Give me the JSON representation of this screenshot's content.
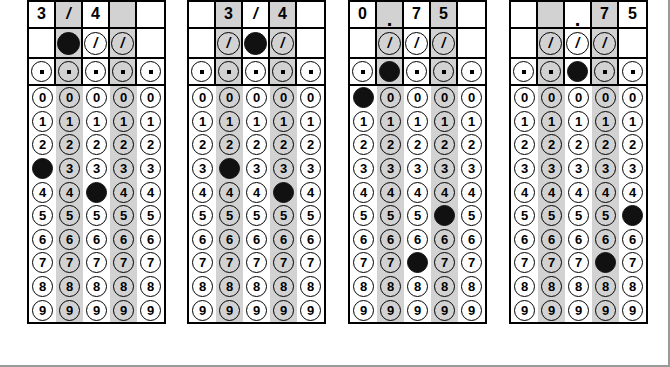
{
  "page": {
    "grid_count": 4,
    "columns_per_grid": 5,
    "frame_color": "#9a9a9a",
    "bubble_fill_color": "#111111",
    "shaded_column_color": "#d2d2d2",
    "shaded_columns": [
      2,
      4
    ]
  },
  "rows": {
    "fraction_label": "/",
    "decimal_label": ".",
    "digit_labels": [
      "0",
      "1",
      "2",
      "3",
      "4",
      "5",
      "6",
      "7",
      "8",
      "9"
    ]
  },
  "grids": [
    {
      "name": "grid-1",
      "written_answer": "3/4",
      "header": [
        "3",
        "/",
        "4",
        "",
        ""
      ],
      "fraction_row": [
        "none",
        "filled",
        "open",
        "open",
        "none"
      ],
      "decimal_row": [
        "open",
        "open",
        "open",
        "open",
        "open"
      ],
      "marked_digits": [
        "3",
        "",
        "4",
        "",
        ""
      ]
    },
    {
      "name": "grid-2",
      "written_answer": "3/4",
      "header": [
        "",
        "3",
        "/",
        "4",
        ""
      ],
      "fraction_row": [
        "none",
        "open",
        "filled",
        "open",
        "none"
      ],
      "decimal_row": [
        "open",
        "open",
        "open",
        "open",
        "open"
      ],
      "marked_digits": [
        "",
        "3",
        "",
        "4",
        ""
      ]
    },
    {
      "name": "grid-3",
      "written_answer": "0.75",
      "header": [
        "0",
        ".",
        "7",
        "5",
        ""
      ],
      "fraction_row": [
        "none",
        "open",
        "open",
        "open",
        "none"
      ],
      "decimal_row": [
        "open",
        "filled",
        "open",
        "open",
        "open"
      ],
      "marked_digits": [
        "0",
        "",
        "7",
        "5",
        ""
      ]
    },
    {
      "name": "grid-4",
      "written_answer": ".75",
      "header": [
        "",
        "",
        ".",
        "7",
        "5"
      ],
      "fraction_row": [
        "none",
        "open",
        "open",
        "open",
        "none"
      ],
      "decimal_row": [
        "open",
        "open",
        "filled",
        "open",
        "open"
      ],
      "marked_digits": [
        "",
        "",
        "",
        "7",
        "5"
      ]
    }
  ]
}
